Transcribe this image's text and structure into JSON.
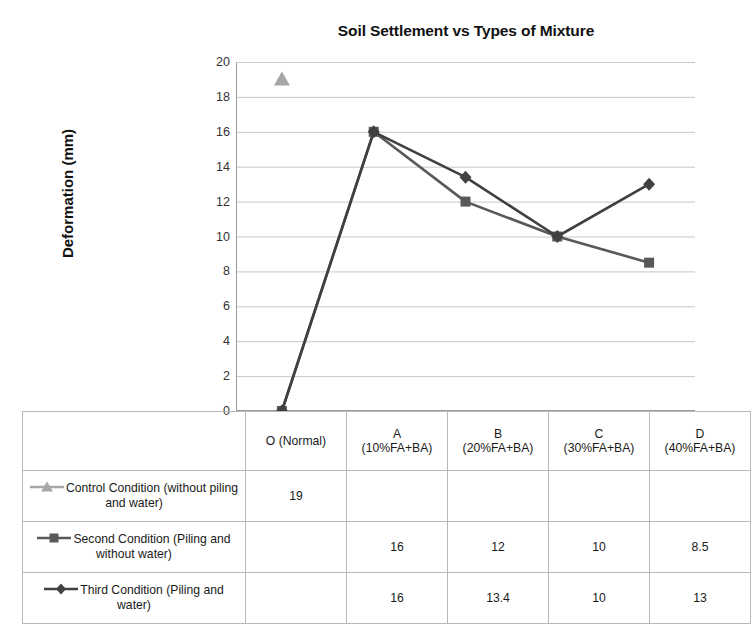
{
  "chart_data": {
    "type": "line",
    "title": "Soil Settlement vs Types of Mixture",
    "xlabel": "",
    "ylabel": "Deformation (mm)",
    "ylim": [
      0,
      20
    ],
    "ytick_step": 2,
    "yticks": [
      20,
      18,
      16,
      14,
      12,
      10,
      8,
      6,
      4,
      2,
      0
    ],
    "grid": true,
    "legend_position": "data-table-below",
    "categories": [
      {
        "letter": "",
        "formula": "O (Normal)"
      },
      {
        "letter": "A",
        "formula": "(10%FA+BA)"
      },
      {
        "letter": "B",
        "formula": "(20%FA+BA)"
      },
      {
        "letter": "C",
        "formula": "(30%FA+BA)"
      },
      {
        "letter": "D",
        "formula": "(40%FA+BA)"
      }
    ],
    "category_labels": [
      "O (Normal)",
      "A (10%FA+BA)",
      "B (20%FA+BA)",
      "C (30%FA+BA)",
      "D (40%FA+BA)"
    ],
    "series": [
      {
        "name": "Control Condition (without piling and water)",
        "marker": "triangle",
        "color": "#a6a6a6",
        "values": [
          19,
          null,
          null,
          null,
          null
        ],
        "cells": [
          "19",
          "",
          "",
          "",
          ""
        ]
      },
      {
        "name": "Second Condition (Piling and without water)",
        "marker": "square",
        "color": "#595959",
        "values": [
          0,
          16,
          12,
          10,
          8.5
        ],
        "cells": [
          "",
          "16",
          "12",
          "10",
          "8.5"
        ]
      },
      {
        "name": "Third Condition (Piling and water)",
        "marker": "diamond",
        "color": "#404040",
        "values": [
          0,
          16,
          13.4,
          10,
          13
        ],
        "cells": [
          "",
          "16",
          "13.4",
          "10",
          "13"
        ]
      }
    ]
  },
  "colors": {
    "gridline": "#c8c8c8",
    "axis": "#9a9a9a",
    "series_control": "#a6a6a6",
    "series_second": "#595959",
    "series_third": "#404040",
    "background": "#ffffff"
  }
}
